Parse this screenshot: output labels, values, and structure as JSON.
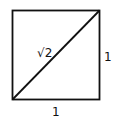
{
  "diagram": {
    "title": "",
    "shape": "unit-square-with-diagonal",
    "stroke_color": "#111111",
    "labels": {
      "diagonal": "√2",
      "right_side": "1",
      "bottom_side": "1"
    }
  }
}
